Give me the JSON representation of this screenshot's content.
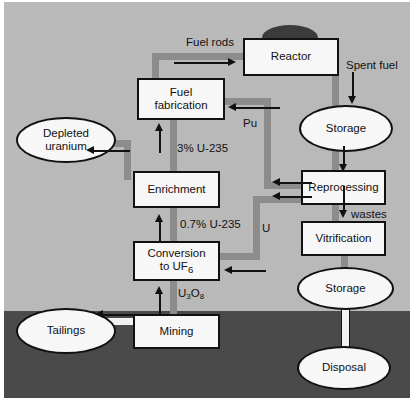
{
  "diagram": {
    "colors": {
      "above_ground": "#b9b9b9",
      "below_ground": "#4a4a4a",
      "pipe": "#8c8c8c",
      "node_fill": "#f7f7f7",
      "outline": "#111111",
      "dome": "#3b3b3b"
    },
    "nodes": [
      {
        "id": "reactor",
        "label": "Reactor",
        "shape": "box"
      },
      {
        "id": "fuel-fabrication",
        "label": "Fuel\nfabrication",
        "shape": "box"
      },
      {
        "id": "depleted-uranium",
        "label": "Depleted\nuranium",
        "shape": "ellipse"
      },
      {
        "id": "enrichment",
        "label": "Enrichment",
        "shape": "box"
      },
      {
        "id": "conversion",
        "label": "Conversion\nto UF6",
        "shape": "box"
      },
      {
        "id": "mining",
        "label": "Mining",
        "shape": "box"
      },
      {
        "id": "tailings",
        "label": "Tailings",
        "shape": "ellipse"
      },
      {
        "id": "storage-spent",
        "label": "Storage",
        "shape": "ellipse"
      },
      {
        "id": "reprocessing",
        "label": "Reprocessing",
        "shape": "box"
      },
      {
        "id": "vitrification",
        "label": "Vitrification",
        "shape": "box"
      },
      {
        "id": "storage-waste",
        "label": "Storage",
        "shape": "ellipse"
      },
      {
        "id": "disposal",
        "label": "Disposal",
        "shape": "ellipse"
      }
    ],
    "node_labels": {
      "reactor": "Reactor",
      "fuel_fabrication_line1": "Fuel",
      "fuel_fabrication_line2": "fabrication",
      "depleted_uranium_line1": "Depleted",
      "depleted_uranium_line2": "uranium",
      "enrichment": "Enrichment",
      "conversion_line1": "Conversion",
      "conversion_line2_pre": "to UF",
      "conversion_line2_sub": "6",
      "mining": "Mining",
      "tailings": "Tailings",
      "storage_spent": "Storage",
      "reprocessing": "Reprocessing",
      "vitrification": "Vitrification",
      "storage_waste": "Storage",
      "disposal": "Disposal"
    },
    "edge_labels": {
      "fuel_rods": "Fuel rods",
      "spent_fuel": "Spent fuel",
      "plutonium": "Pu",
      "enriched_uranium": "3% U-235",
      "natural_uranium": "0.7% U-235",
      "uranium": "U",
      "yellowcake_pre": "U",
      "yellowcake_sub1": "3",
      "yellowcake_mid": "O",
      "yellowcake_sub2": "8",
      "wastes": "wastes"
    }
  }
}
